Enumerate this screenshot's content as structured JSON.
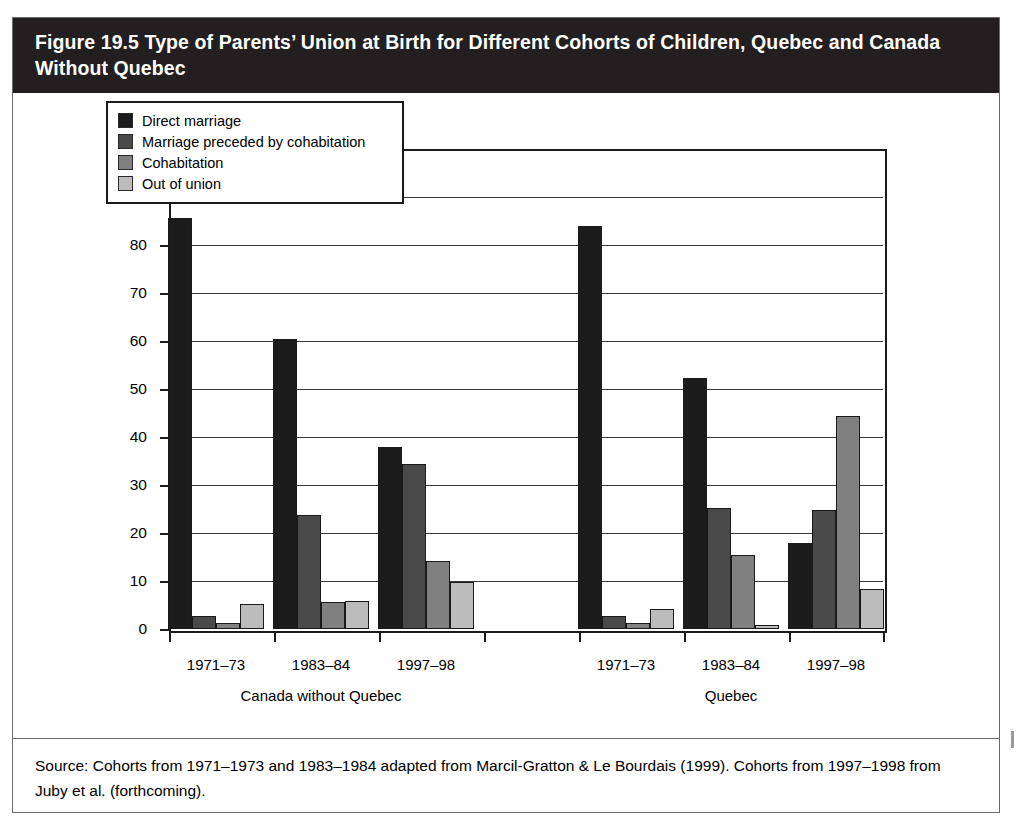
{
  "figure": {
    "title": "Figure 19.5 Type of Parents’ Union at Birth for Different Cohorts of Children, Quebec and Canada Without Quebec",
    "source": "Source: Cohorts from 1971–1973 and 1983–1984 adapted from Marcil-Gratton & Le Bourdais (1999). Cohorts from 1997–1998 from Juby et al. (forthcoming)."
  },
  "chart_data": {
    "type": "bar",
    "title": "Figure 19.5 Type of Parents’ Union at Birth for Different Cohorts of Children, Quebec and Canada Without Quebec",
    "xlabel": "",
    "ylabel": "%",
    "ylim": [
      0,
      100
    ],
    "ytick_labels": [
      "100",
      "90",
      "80",
      "70",
      "60",
      "50",
      "40",
      "30",
      "20",
      "10",
      "0"
    ],
    "ytick_values": [
      100,
      90,
      80,
      70,
      60,
      50,
      40,
      30,
      20,
      10,
      0
    ],
    "grid": true,
    "legend_position": "upper-left-inside",
    "groups": [
      "Canada without Quebec",
      "Quebec"
    ],
    "categories": [
      "1971–73",
      "1983–84",
      "1997–98",
      "1971–73",
      "1983–84",
      "1997–98"
    ],
    "category_groups": [
      "Canada without Quebec",
      "Canada without Quebec",
      "Canada without Quebec",
      "Quebec",
      "Quebec",
      "Quebec"
    ],
    "series": [
      {
        "name": "Direct marriage",
        "color": "#1c1c1c",
        "values": [
          85.7,
          60.5,
          38.0,
          84.0,
          52.3,
          18.0
        ]
      },
      {
        "name": "Marriage preceded by cohabitation",
        "color": "#4a4a4a",
        "values": [
          2.7,
          23.8,
          34.3,
          2.8,
          25.2,
          24.8
        ]
      },
      {
        "name": "Cohabitation",
        "color": "#808080",
        "values": [
          1.2,
          5.7,
          14.2,
          1.3,
          15.5,
          44.3
        ]
      },
      {
        "name": "Out of union",
        "color": "#bcbcbc",
        "values": [
          5.3,
          5.9,
          9.8,
          4.2,
          0.9,
          8.3
        ]
      }
    ]
  },
  "legend": {
    "items": [
      {
        "label": "Direct marriage",
        "color": "#1c1c1c"
      },
      {
        "label": "Marriage preceded by cohabitation",
        "color": "#4a4a4a"
      },
      {
        "label": "Cohabitation",
        "color": "#808080"
      },
      {
        "label": "Out of union",
        "color": "#bcbcbc"
      }
    ]
  },
  "axis": {
    "y_unit": "%"
  }
}
